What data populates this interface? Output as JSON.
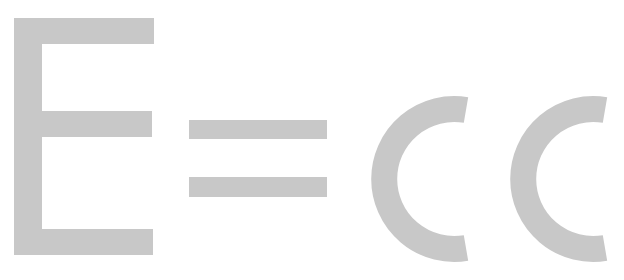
{
  "text": "E=CC",
  "characters": [
    "E",
    "=",
    "C",
    "C"
  ],
  "colors": {
    "glyph": "#c8c8c8",
    "background": "#ffffff"
  }
}
